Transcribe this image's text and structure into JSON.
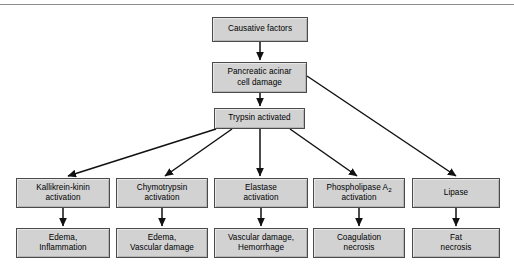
{
  "figure": {
    "width": 514,
    "height": 273,
    "background": "#ffffff",
    "rule_color": "#8d8d8d",
    "node_fill": "#d2d2d2",
    "node_border": "#4a4a4a",
    "edge_color": "#111111"
  },
  "nodes": {
    "causative_factors": {
      "text": "Causative factors",
      "x": 212,
      "y": 17,
      "w": 96,
      "h": 25
    },
    "acinar_damage": {
      "text": "Pancreatic acinar\ncell damage",
      "x": 212,
      "y": 62,
      "w": 95,
      "h": 31
    },
    "trypsin_activated": {
      "text": "Trypsin activated",
      "x": 214,
      "y": 108,
      "w": 91,
      "h": 21
    },
    "kallikrein_activation": {
      "text": "Kallikrein-kinin\nactivation",
      "x": 16,
      "y": 178,
      "w": 94,
      "h": 30
    },
    "chymotrypsin_activation": {
      "text": "Chymotrypsin\nactivation",
      "x": 116,
      "y": 178,
      "w": 92,
      "h": 30
    },
    "elastase_activation": {
      "text": "Elastase\nactivation",
      "x": 214,
      "y": 178,
      "w": 94,
      "h": 30
    },
    "phospholipase_activation": {
      "text": "Phospholipase A2\nactivation",
      "x": 313,
      "y": 178,
      "w": 92,
      "h": 30,
      "subscript": "2",
      "base_text": "Phospholipase A"
    },
    "lipase": {
      "text": "Lipase",
      "x": 412,
      "y": 178,
      "w": 88,
      "h": 30
    },
    "edema_inflammation": {
      "text": "Edema,\nInflammation",
      "x": 16,
      "y": 228,
      "w": 94,
      "h": 30
    },
    "edema_vascular_damage": {
      "text": "Edema,\nVascular damage",
      "x": 116,
      "y": 228,
      "w": 92,
      "h": 30
    },
    "vascular_hemorrhage": {
      "text": "Vascular damage,\nHemorrhage",
      "x": 214,
      "y": 228,
      "w": 94,
      "h": 30
    },
    "coagulation_necrosis": {
      "text": "Coagulation\nnecrosis",
      "x": 313,
      "y": 228,
      "w": 92,
      "h": 30
    },
    "fat_necrosis": {
      "text": "Fat\nnecrosis",
      "x": 412,
      "y": 228,
      "w": 88,
      "h": 30
    }
  },
  "edges": [
    {
      "name": "causative-to-acinar",
      "from": "causative_factors",
      "to": "acinar_damage",
      "x1": 260,
      "y1": 42,
      "x2": 260,
      "y2": 60
    },
    {
      "name": "acinar-to-trypsin",
      "from": "acinar_damage",
      "to": "trypsin_activated",
      "x1": 260,
      "y1": 93,
      "x2": 260,
      "y2": 106
    },
    {
      "name": "acinar-to-lipase",
      "from": "acinar_damage",
      "to": "lipase",
      "x1": 307,
      "y1": 76,
      "x2": 456,
      "y2": 176
    },
    {
      "name": "trypsin-to-kallikrein",
      "from": "trypsin_activated",
      "to": "kallikrein_activation",
      "x1": 216,
      "y1": 129,
      "x2": 68,
      "y2": 176
    },
    {
      "name": "trypsin-to-chymotrypsin",
      "from": "trypsin_activated",
      "to": "chymotrypsin_activation",
      "x1": 232,
      "y1": 129,
      "x2": 165,
      "y2": 176
    },
    {
      "name": "trypsin-to-elastase",
      "from": "trypsin_activated",
      "to": "elastase_activation",
      "x1": 260,
      "y1": 129,
      "x2": 260,
      "y2": 176
    },
    {
      "name": "trypsin-to-phospholipase",
      "from": "trypsin_activated",
      "to": "phospholipase_activation",
      "x1": 290,
      "y1": 129,
      "x2": 357,
      "y2": 176
    },
    {
      "name": "kallikrein-to-edema",
      "from": "kallikrein_activation",
      "to": "edema_inflammation",
      "x1": 63,
      "y1": 208,
      "x2": 63,
      "y2": 226
    },
    {
      "name": "chymotrypsin-to-edema",
      "from": "chymotrypsin_activation",
      "to": "edema_vascular_damage",
      "x1": 162,
      "y1": 208,
      "x2": 162,
      "y2": 226
    },
    {
      "name": "elastase-to-vascular",
      "from": "elastase_activation",
      "to": "vascular_hemorrhage",
      "x1": 261,
      "y1": 208,
      "x2": 261,
      "y2": 226
    },
    {
      "name": "phospholipase-to-coagulation",
      "from": "phospholipase_activation",
      "to": "coagulation_necrosis",
      "x1": 359,
      "y1": 208,
      "x2": 359,
      "y2": 226
    },
    {
      "name": "lipase-to-fat-necrosis",
      "from": "lipase",
      "to": "fat_necrosis",
      "x1": 456,
      "y1": 208,
      "x2": 456,
      "y2": 226
    }
  ]
}
